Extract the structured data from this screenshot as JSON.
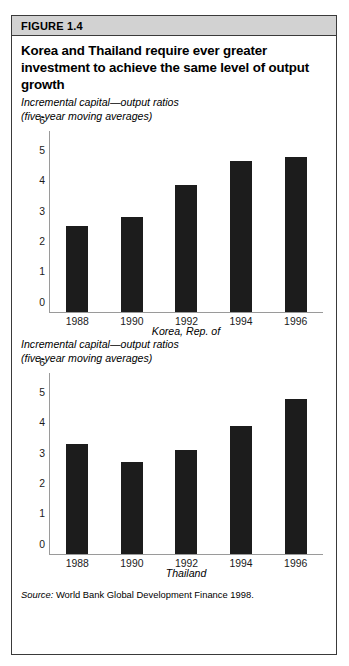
{
  "figure": {
    "label": "FIGURE 1.4",
    "title": "Korea and Thailand require ever greater investment to achieve the same level of output growth",
    "source_word": "Source:",
    "source_text": " World Bank Global Development Finance 1998.",
    "colors": {
      "bar": "#1c1c1c",
      "header_band": "#d2d2d2",
      "frame_border": "#3a3a3a",
      "axis": "#9a9a9a"
    }
  },
  "panels": [
    {
      "subtitle_line1": "Incremental capital—output ratios",
      "subtitle_line2": "(five-year moving averages)"
    },
    {
      "subtitle_line1": "Incremental capital—output ratios",
      "subtitle_line2": "(five-year moving averages)"
    }
  ],
  "chart_data": [
    {
      "type": "bar",
      "title": "Korea, Rep. of",
      "xlabel": "Korea, Rep. of",
      "ylabel": "Incremental capital—output ratios (five-year moving averages)",
      "categories": [
        "1988",
        "1990",
        "1992",
        "1994",
        "1996"
      ],
      "values": [
        2.85,
        3.15,
        4.2,
        5.0,
        5.15
      ],
      "ylim": [
        0,
        6
      ],
      "yticks": [
        "6",
        "5",
        "4",
        "3",
        "2",
        "1",
        "0"
      ],
      "grid": false,
      "legend": "none"
    },
    {
      "type": "bar",
      "title": "Thailand",
      "xlabel": "Thailand",
      "ylabel": "Incremental capital—output ratios (five-year moving averages)",
      "categories": [
        "1988",
        "1990",
        "1992",
        "1994",
        "1996"
      ],
      "values": [
        3.65,
        3.05,
        3.45,
        4.25,
        5.15
      ],
      "ylim": [
        0,
        6
      ],
      "yticks": [
        "6",
        "5",
        "4",
        "3",
        "2",
        "1",
        "0"
      ],
      "grid": false,
      "legend": "none"
    }
  ]
}
